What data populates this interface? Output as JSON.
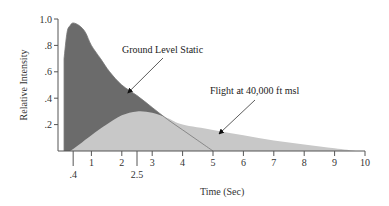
{
  "chart_data": {
    "type": "area",
    "title": "",
    "xlabel": "Time (Sec)",
    "ylabel": "Relative Intensity",
    "xlim": [
      0,
      10
    ],
    "ylim": [
      0,
      1.0
    ],
    "x_ticks": [
      "1",
      "2",
      "3",
      "4",
      "5",
      "6",
      "7",
      "8",
      "9",
      "10"
    ],
    "x_extra_ticks": [
      ".4",
      "2.5"
    ],
    "y_ticks": [
      ".2",
      ".4",
      ".6",
      ".8",
      "1.0"
    ],
    "grid": false,
    "series": [
      {
        "name": "Ground Level Static",
        "color": "#6b6b6b",
        "x": [
          0.1,
          0.2,
          0.3,
          0.4,
          0.6,
          0.8,
          1.0,
          1.3,
          1.6,
          2.0,
          2.5,
          3.0,
          3.5,
          4.0,
          4.5,
          5.0
        ],
        "values": [
          0.7,
          0.9,
          0.95,
          0.97,
          0.95,
          0.9,
          0.8,
          0.7,
          0.6,
          0.5,
          0.42,
          0.33,
          0.24,
          0.16,
          0.08,
          0.0
        ]
      },
      {
        "name": "Flight at 40,000 ft msl",
        "color": "#c8c8c8",
        "x": [
          0.3,
          0.6,
          1.0,
          1.5,
          2.0,
          2.5,
          3.0,
          3.5,
          4.0,
          5.0,
          6.0,
          7.0,
          8.0,
          9.0,
          9.7
        ],
        "values": [
          0.0,
          0.05,
          0.12,
          0.2,
          0.27,
          0.3,
          0.29,
          0.25,
          0.2,
          0.16,
          0.12,
          0.08,
          0.05,
          0.02,
          0.0
        ]
      }
    ],
    "annotations": [
      {
        "text": "Ground Level Static",
        "arrow_to": [
          2.2,
          0.44
        ]
      },
      {
        "text": "Flight at 40,000 ft msl",
        "arrow_to": [
          5.2,
          0.13
        ]
      }
    ]
  }
}
